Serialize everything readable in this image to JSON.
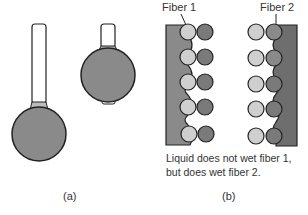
{
  "panel_a": {
    "label": "(a)",
    "objects": [
      {
        "name": "long-neck-droplet",
        "neck_length": "long"
      },
      {
        "name": "short-neck-droplet",
        "neck_length": "short"
      }
    ]
  },
  "panel_b": {
    "label": "(b)",
    "fiber1_label": "Fiber 1",
    "fiber2_label": "Fiber 2",
    "caption_line1": "Liquid does not wet fiber 1,",
    "caption_line2": "but does wet fiber 2.",
    "rows": 5
  },
  "colors": {
    "liquid": "#8a8a8a",
    "fiber_dark": "#6e6e6e",
    "light_circle": "#cfcfcf",
    "dark_circle": "#7a7a7a",
    "neck_band": "#bdbdbd",
    "stroke": "#222222"
  }
}
